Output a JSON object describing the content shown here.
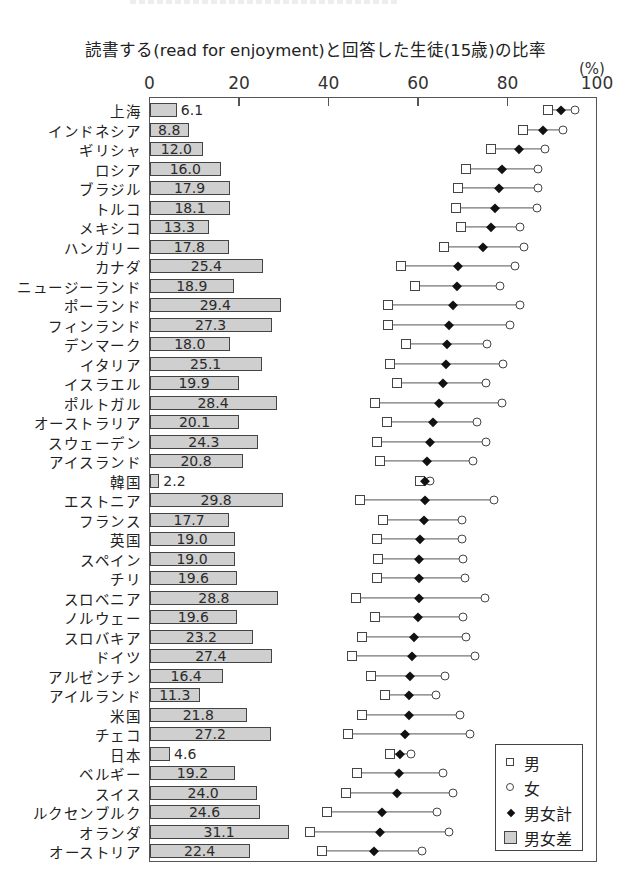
{
  "chart_data": {
    "type": "dot-bar-combo",
    "title": "読書する(read for enjoyment)と回答した生徒(15歳)の比率",
    "unit": "(%)",
    "xlim": [
      0,
      100
    ],
    "x_ticks": [
      0,
      20,
      40,
      60,
      80,
      100
    ],
    "legend": [
      {
        "key": "male",
        "label": "男",
        "marker": "open-square"
      },
      {
        "key": "female",
        "label": "女",
        "marker": "open-circle"
      },
      {
        "key": "total",
        "label": "男女計",
        "marker": "filled-diamond"
      },
      {
        "key": "gap",
        "label": "男女差",
        "marker": "gray-bar"
      }
    ],
    "legend_position": "lower-right",
    "grid": false,
    "categories": [
      "上海",
      "インドネシア",
      "ギリシャ",
      "ロシア",
      "ブラジル",
      "トルコ",
      "メキシコ",
      "ハンガリー",
      "カナダ",
      "ニュージーランド",
      "ポーランド",
      "フィンランド",
      "デンマーク",
      "イタリア",
      "イスラエル",
      "ポルトガル",
      "オーストラリア",
      "スウェーデン",
      "アイスランド",
      "韓国",
      "エストニア",
      "フランス",
      "英国",
      "スペイン",
      "チリ",
      "スロベニア",
      "ノルウェー",
      "スロバキア",
      "ドイツ",
      "アルゼンチン",
      "アイルランド",
      "米国",
      "チェコ",
      "日本",
      "ベルギー",
      "スイス",
      "ルクセンブルク",
      "オランダ",
      "オーストリア"
    ],
    "series": [
      {
        "name": "男女差",
        "key": "gap",
        "type": "bar",
        "values": [
          6.1,
          8.8,
          12.0,
          16.0,
          17.9,
          18.1,
          13.3,
          17.8,
          25.4,
          18.9,
          29.4,
          27.3,
          18.0,
          25.1,
          19.9,
          28.4,
          20.1,
          24.3,
          20.8,
          2.2,
          29.8,
          17.7,
          19.0,
          19.0,
          19.6,
          28.8,
          19.6,
          23.2,
          27.4,
          16.4,
          11.3,
          21.8,
          27.2,
          4.6,
          19.2,
          24.0,
          24.6,
          31.1,
          22.4
        ]
      },
      {
        "name": "男",
        "key": "male",
        "type": "scatter",
        "values": [
          89.0,
          83.5,
          76.3,
          70.8,
          69.0,
          68.5,
          69.6,
          65.8,
          56.3,
          59.4,
          53.3,
          53.3,
          57.4,
          53.8,
          55.4,
          50.4,
          53.1,
          50.9,
          51.6,
          60.5,
          47.1,
          52.2,
          50.9,
          51.1,
          50.9,
          46.2,
          50.4,
          47.5,
          45.3,
          49.6,
          52.7,
          47.5,
          44.4,
          53.8,
          46.4,
          43.8,
          39.7,
          35.9,
          38.6
        ]
      },
      {
        "name": "男女計",
        "key": "total",
        "type": "scatter",
        "values": [
          92.0,
          88.0,
          82.6,
          78.8,
          78.0,
          77.2,
          76.3,
          74.6,
          69.0,
          68.8,
          67.9,
          67.0,
          66.5,
          66.3,
          65.6,
          64.7,
          63.4,
          62.7,
          62.0,
          61.6,
          61.6,
          61.4,
          60.5,
          60.3,
          60.3,
          60.3,
          60.0,
          59.2,
          58.7,
          58.3,
          58.0,
          58.0,
          57.1,
          56.0,
          55.8,
          55.4,
          52.0,
          51.6,
          50.2
        ]
      },
      {
        "name": "女",
        "key": "female",
        "type": "scatter",
        "values": [
          95.1,
          92.3,
          88.3,
          86.8,
          86.9,
          86.6,
          82.9,
          83.6,
          81.7,
          78.3,
          82.7,
          80.6,
          75.4,
          78.9,
          75.3,
          78.8,
          73.2,
          75.2,
          72.4,
          62.7,
          76.9,
          69.9,
          69.9,
          70.1,
          70.5,
          75.0,
          70.0,
          70.7,
          72.7,
          66.0,
          64.0,
          69.3,
          71.6,
          58.4,
          65.6,
          67.8,
          64.3,
          67.0,
          61.0
        ]
      }
    ]
  },
  "labels": {
    "title": "読書する(read for enjoyment)と回答した生徒(15歳)の比率",
    "unit": "(%)"
  },
  "colors": {
    "bar_fill": "#cfcfcf",
    "marker_stroke": "#444444",
    "diamond_fill": "#111111"
  }
}
